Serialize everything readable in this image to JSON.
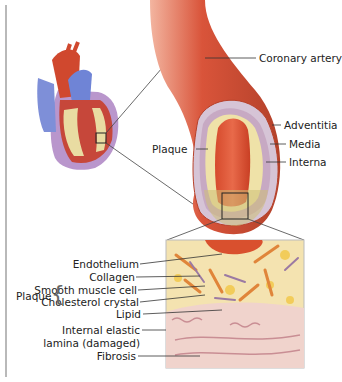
{
  "labels": {
    "coronary_artery": "Coronary artery",
    "plaque": "Plaque",
    "adventitia": "Adventitia",
    "media": "Media",
    "interna": "Interna",
    "endothelium": "Endothelium",
    "collagen": "Collagen",
    "smooth_muscle_cell": "Smooth muscle cell",
    "cholesterol_crystal": "Cholesterol crystal",
    "lipid": "Lipid",
    "internal_elastic_1": "Internal elastic",
    "internal_elastic_2": "lamina (damaged)",
    "fibrosis": "Fibrosis",
    "plaque_group": "Plaque"
  },
  "colors": {
    "artery": "#d9543a",
    "lumen": "#e2502e",
    "plaque": "#efe2a8",
    "media": "#c9b4c8",
    "tissue": "#f1d5d0",
    "vein_blue": "#6c7fd0"
  }
}
